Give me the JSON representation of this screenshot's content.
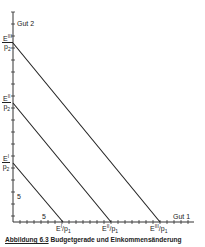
{
  "diagram": {
    "y_axis_label": "Gut 2",
    "x_axis_label": "Gut 1",
    "y_intercepts": [
      {
        "num": "E",
        "sup": "III",
        "den": "p",
        "sub": "2"
      },
      {
        "num": "E",
        "sup": "II",
        "den": "p",
        "sub": "2"
      },
      {
        "num": "E",
        "sup": "I",
        "den": "p",
        "sub": "2"
      }
    ],
    "x_intercepts": [
      {
        "main": "E",
        "sup": "I",
        "rest": "/p",
        "sub": "1"
      },
      {
        "main": "E",
        "sup": "II",
        "rest": "/p",
        "sub": "1"
      },
      {
        "main": "E",
        "sup": "III",
        "rest": "/p",
        "sub": "1"
      }
    ],
    "tick_label_y": "5",
    "tick_label_x": "5",
    "caption_figure": "Abbildung 6.3",
    "caption_title": "Budgetgerade und Einkommensänderung"
  }
}
